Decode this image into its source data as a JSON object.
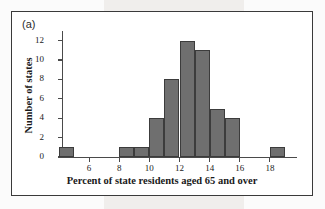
{
  "figure": {
    "panel_label": "(a)",
    "bar_color": "#6f6f6f",
    "bar_edge_color": "#3c3c3c",
    "axis_color": "#4a4a4a",
    "frame_color": "#3a3a3a"
  },
  "chart_data": {
    "type": "bar",
    "title": "",
    "subtitle": "",
    "xlabel": "Percent of state residents aged 65 and over",
    "ylabel": "Number of states",
    "annotations": [
      "(a)"
    ],
    "grid": false,
    "legend": null,
    "xlim": [
      4.2,
      19.8
    ],
    "ylim": [
      0,
      13
    ],
    "bin_width": 1,
    "xticks": [
      6,
      8,
      10,
      12,
      14,
      16,
      18
    ],
    "xtick_labels": [
      "6",
      "8",
      "10",
      "12",
      "14",
      "16",
      "18"
    ],
    "yticks": [
      0,
      2,
      4,
      6,
      8,
      10,
      12
    ],
    "ytick_labels": [
      "0",
      "2",
      "4",
      "6",
      "8",
      "10",
      "12"
    ],
    "bins": [
      {
        "left": 4,
        "right": 5,
        "count": 1
      },
      {
        "left": 8,
        "right": 9,
        "count": 1
      },
      {
        "left": 9,
        "right": 10,
        "count": 1
      },
      {
        "left": 10,
        "right": 11,
        "count": 4
      },
      {
        "left": 11,
        "right": 12,
        "count": 8
      },
      {
        "left": 12,
        "right": 13,
        "count": 12
      },
      {
        "left": 13,
        "right": 14,
        "count": 11
      },
      {
        "left": 14,
        "right": 15,
        "count": 5
      },
      {
        "left": 15,
        "right": 16,
        "count": 4
      },
      {
        "left": 18,
        "right": 19,
        "count": 1
      }
    ],
    "categories": [
      "4-5",
      "8-9",
      "9-10",
      "10-11",
      "11-12",
      "12-13",
      "13-14",
      "14-15",
      "15-16",
      "18-19"
    ],
    "values": [
      1,
      1,
      1,
      4,
      8,
      12,
      11,
      5,
      4,
      1
    ],
    "total_count": 48
  }
}
